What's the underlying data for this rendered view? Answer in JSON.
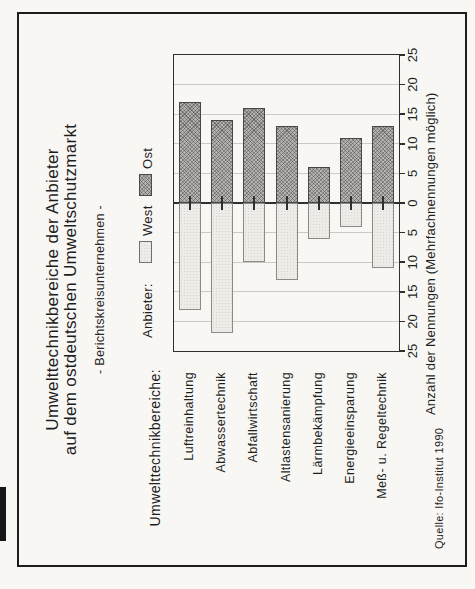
{
  "page": {
    "background": "#f8f7f4",
    "scan_artifact": "black strip on left page edge"
  },
  "chart_data": {
    "type": "bar",
    "orientation": "diverging horizontal bars; whole figure printed rotated 90° counter-clockwise on portrait page",
    "title": [
      "Umwelttechnikbereiche der Anbieter",
      "auf dem ostdeutschen Umweltschutzmarkt"
    ],
    "subtitle": "- Berichtskreisunternehmen -",
    "legend_title": "Anbieter:",
    "categories": [
      "Luftreinhaltung",
      "Abwassertechnik",
      "Abfallwirtschaft",
      "Altlastensanierung",
      "Lärmbekämpfung",
      "Energieeinsparung",
      "Meß- u. Regeltechnik"
    ],
    "series": [
      {
        "name": "West",
        "values": [
          18,
          22,
          10,
          13,
          6,
          4,
          11
        ],
        "direction": "left",
        "style": "light dotted fill"
      },
      {
        "name": "Ost",
        "values": [
          17,
          14,
          16,
          13,
          6,
          11,
          13
        ],
        "direction": "right",
        "style": "dark crosshatch fill"
      }
    ],
    "category_axis_title": "Umwelttechnikbereiche:",
    "value_axis_title": "Anzahl der Nennungen (Mehrfachnennungen möglich)",
    "value_ticks": [
      "25",
      "20",
      "15",
      "10",
      "5",
      "0",
      "5",
      "10",
      "15",
      "20",
      "25"
    ],
    "value_range_each_side": [
      0,
      25
    ],
    "gridline_step": 5,
    "grid": true,
    "legend_position": "above plot",
    "source": "Quelle: Ifo-Institut 1990",
    "colors": {
      "paper": "#f8f7f4",
      "frame": "#1c1c1c",
      "plot_frame": "#2f2f2f",
      "grid": "#cbcac6",
      "text": "#1f1f1f",
      "west_fill": "#edece9",
      "west_border": "#8a8a86",
      "ost_fill": "#b5b3af",
      "ost_hatch": "#303030",
      "ost_border": "#474745"
    }
  }
}
